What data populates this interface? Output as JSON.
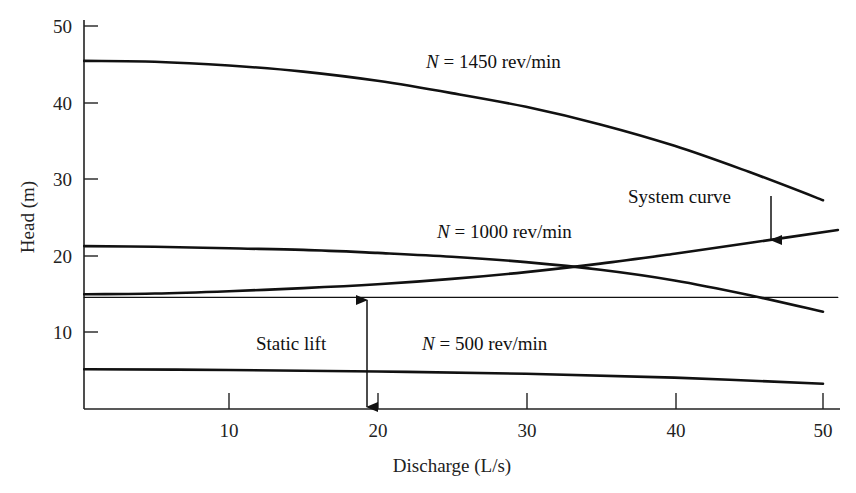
{
  "chart_data": {
    "type": "line",
    "title": "",
    "xlabel": "Discharge (L/s)",
    "ylabel": "Head (m)",
    "xlim": [
      0,
      51
    ],
    "ylim": [
      0,
      50
    ],
    "xticks": [
      10,
      20,
      30,
      40,
      50
    ],
    "yticks": [
      10,
      20,
      30,
      40,
      50
    ],
    "grid": false,
    "legend": "none (inline annotations)",
    "series": [
      {
        "name": "N = 1450 rev/min",
        "x": [
          0,
          5,
          10,
          15,
          20,
          25,
          30,
          35,
          40,
          45,
          50
        ],
        "values": [
          45.5,
          45.4,
          44.9,
          44.1,
          42.9,
          41.3,
          39.5,
          37.2,
          34.4,
          31.0,
          27.3
        ]
      },
      {
        "name": "N = 1000 rev/min",
        "x": [
          0,
          5,
          10,
          15,
          20,
          25,
          30,
          35,
          40,
          45,
          50
        ],
        "values": [
          21.3,
          21.2,
          21.0,
          20.8,
          20.4,
          19.9,
          19.2,
          18.2,
          16.8,
          14.9,
          12.7
        ]
      },
      {
        "name": "N = 500 rev/min",
        "x": [
          0,
          10,
          20,
          30,
          40,
          50
        ],
        "values": [
          5.2,
          5.1,
          4.9,
          4.6,
          4.1,
          3.3
        ]
      },
      {
        "name": "System curve",
        "x": [
          0,
          5,
          10,
          15,
          20,
          25,
          30,
          35,
          40,
          45,
          51
        ],
        "values": [
          15.0,
          15.1,
          15.4,
          15.8,
          16.3,
          17.0,
          17.9,
          19.0,
          20.3,
          21.7,
          23.4
        ]
      },
      {
        "name": "Static lift",
        "x": [
          0,
          51
        ],
        "values": [
          14.6,
          14.6
        ]
      }
    ],
    "annotations": [
      {
        "text": "N = 1450 rev/min",
        "x": 30,
        "y": 47.5
      },
      {
        "text": "N = 1000 rev/min",
        "x": 30,
        "y": 23.3
      },
      {
        "text": "N = 500 rev/min",
        "x": 30,
        "y": 8.3
      },
      {
        "text": "Static lift",
        "x": 14,
        "y": 8.3,
        "arrow": "double, vertical at Q≈19.5 from 0 to 14.6 m"
      },
      {
        "text": "System curve",
        "x": 42,
        "y": 27.8,
        "arrow": "down to system curve at Q≈46.5"
      }
    ]
  },
  "labels": {
    "n1450_var": "N",
    "n1450_rest": " = 1450 rev/min",
    "n1000_var": "N",
    "n1000_rest": " = 1000 rev/min",
    "n500_var": "N",
    "n500_rest": " = 500 rev/min",
    "static_lift": "Static lift",
    "system_curve": "System curve"
  },
  "axes": {
    "x_title": "Discharge (L/s)",
    "y_title": "Head (m)",
    "x_ticks": [
      "10",
      "20",
      "30",
      "40",
      "50"
    ],
    "y_ticks": [
      "10",
      "20",
      "30",
      "40",
      "50"
    ]
  }
}
